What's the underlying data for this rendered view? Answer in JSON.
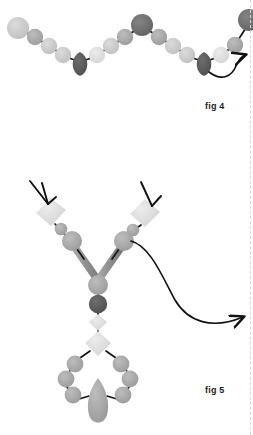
{
  "page": {
    "background_color": "#ffffff",
    "width": 253,
    "height": 435,
    "edge_rule_color": "#d7d7d7"
  },
  "palette": {
    "bead_light": "#c9c9c9",
    "bead_mid": "#a8a8a8",
    "bead_dark": "#6e6e6e",
    "bead_very_dark": "#5a5a5a",
    "bead_pale": "#e2e2e2",
    "cord": "#1a1a1a",
    "arrow": "#111111",
    "label_text": "#1d1d1d"
  },
  "figures": [
    {
      "id": "fig4",
      "label": "fig 4",
      "caption_position": {
        "x": 205,
        "y": 101
      },
      "description": "zigzag beaded chain with dark drop beads at the two valleys",
      "arrow": {
        "name": "pointer-arrow-fig4",
        "from": {
          "x": 70,
          "y": 66
        },
        "to": {
          "x": 246,
          "y": 55
        },
        "style": "curved"
      },
      "beads": [
        {
          "shape": "circle",
          "cx": 18,
          "cy": 28,
          "r": 11,
          "tone": "bead_light"
        },
        {
          "shape": "circle",
          "cx": 35,
          "cy": 37,
          "r": 8,
          "tone": "bead_mid"
        },
        {
          "shape": "circle",
          "cx": 49,
          "cy": 46,
          "r": 8,
          "tone": "bead_light"
        },
        {
          "shape": "circle",
          "cx": 63,
          "cy": 55,
          "r": 8,
          "tone": "bead_light"
        },
        {
          "shape": "drop",
          "cx": 80,
          "cy": 66,
          "r": 10,
          "tone": "bead_very_dark"
        },
        {
          "shape": "circle",
          "cx": 97,
          "cy": 55,
          "r": 8,
          "tone": "bead_pale"
        },
        {
          "shape": "circle",
          "cx": 111,
          "cy": 46,
          "r": 8,
          "tone": "bead_light"
        },
        {
          "shape": "circle",
          "cx": 125,
          "cy": 37,
          "r": 8,
          "tone": "bead_mid"
        },
        {
          "shape": "circle",
          "cx": 142,
          "cy": 25,
          "r": 11,
          "tone": "bead_dark"
        },
        {
          "shape": "circle",
          "cx": 159,
          "cy": 37,
          "r": 8,
          "tone": "bead_mid"
        },
        {
          "shape": "circle",
          "cx": 173,
          "cy": 46,
          "r": 8,
          "tone": "bead_light"
        },
        {
          "shape": "circle",
          "cx": 187,
          "cy": 55,
          "r": 8,
          "tone": "bead_light"
        },
        {
          "shape": "drop",
          "cx": 204,
          "cy": 66,
          "r": 10,
          "tone": "bead_very_dark"
        },
        {
          "shape": "circle",
          "cx": 221,
          "cy": 55,
          "r": 8,
          "tone": "bead_pale"
        },
        {
          "shape": "circle",
          "cx": 235,
          "cy": 45,
          "r": 8,
          "tone": "bead_mid"
        },
        {
          "shape": "circle",
          "cx": 249,
          "cy": 20,
          "r": 11,
          "tone": "bead_dark"
        }
      ],
      "cords": [
        {
          "from": {
            "x": 18,
            "y": 28
          },
          "to": {
            "x": 35,
            "y": 37
          }
        },
        {
          "from": {
            "x": 35,
            "y": 37
          },
          "to": {
            "x": 49,
            "y": 46
          }
        },
        {
          "from": {
            "x": 49,
            "y": 46
          },
          "to": {
            "x": 63,
            "y": 55
          }
        },
        {
          "from": {
            "x": 63,
            "y": 55
          },
          "to": {
            "x": 80,
            "y": 62
          }
        },
        {
          "from": {
            "x": 80,
            "y": 62
          },
          "to": {
            "x": 97,
            "y": 55
          }
        },
        {
          "from": {
            "x": 97,
            "y": 55
          },
          "to": {
            "x": 111,
            "y": 46
          }
        },
        {
          "from": {
            "x": 111,
            "y": 46
          },
          "to": {
            "x": 125,
            "y": 37
          }
        },
        {
          "from": {
            "x": 125,
            "y": 37
          },
          "to": {
            "x": 142,
            "y": 25
          }
        },
        {
          "from": {
            "x": 142,
            "y": 25
          },
          "to": {
            "x": 159,
            "y": 37
          }
        },
        {
          "from": {
            "x": 159,
            "y": 37
          },
          "to": {
            "x": 173,
            "y": 46
          }
        },
        {
          "from": {
            "x": 173,
            "y": 46
          },
          "to": {
            "x": 187,
            "y": 55
          }
        },
        {
          "from": {
            "x": 187,
            "y": 55
          },
          "to": {
            "x": 204,
            "y": 62
          }
        },
        {
          "from": {
            "x": 204,
            "y": 62
          },
          "to": {
            "x": 221,
            "y": 55
          }
        },
        {
          "from": {
            "x": 221,
            "y": 55
          },
          "to": {
            "x": 235,
            "y": 45
          }
        },
        {
          "from": {
            "x": 235,
            "y": 45
          },
          "to": {
            "x": 249,
            "y": 22
          }
        }
      ]
    },
    {
      "id": "fig5",
      "label": "fig 5",
      "caption_position": {
        "x": 205,
        "y": 385
      },
      "description": "Y-shaped beaded necklace: two upper arms with pale diamond beads marked by arrowheads, joining at a central bead column and finishing in a bead ring with teardrop pendant",
      "arrow": {
        "name": "pointer-arrow-fig5",
        "from": {
          "x": 128,
          "y": 239
        },
        "to": {
          "x": 246,
          "y": 318
        },
        "style": "s-curve"
      },
      "arrowheads": [
        {
          "name": "arrowhead-left-diamond",
          "tip": {
            "x": 48,
            "y": 203
          },
          "from": {
            "x": 30,
            "y": 181
          }
        },
        {
          "name": "arrowhead-right-diamond",
          "tip": {
            "x": 152,
            "y": 205
          },
          "from": {
            "x": 145,
            "y": 182
          }
        }
      ],
      "beads": [
        {
          "shape": "diamond",
          "cx": 51,
          "cy": 212,
          "r": 14,
          "tone": "bead_pale"
        },
        {
          "shape": "circle",
          "cx": 61,
          "cy": 229,
          "r": 6,
          "tone": "bead_mid"
        },
        {
          "shape": "circle",
          "cx": 72,
          "cy": 241,
          "r": 10,
          "tone": "bead_mid"
        },
        {
          "shape": "diamond",
          "cx": 145,
          "cy": 213,
          "r": 14,
          "tone": "bead_pale"
        },
        {
          "shape": "circle",
          "cx": 133,
          "cy": 230,
          "r": 6,
          "tone": "bead_mid"
        },
        {
          "shape": "circle",
          "cx": 124,
          "cy": 241,
          "r": 10,
          "tone": "bead_mid"
        },
        {
          "shape": "circle",
          "cx": 98,
          "cy": 285,
          "r": 10,
          "tone": "bead_mid"
        },
        {
          "shape": "circle",
          "cx": 98,
          "cy": 304,
          "r": 9,
          "tone": "bead_very_dark"
        },
        {
          "shape": "diamond",
          "cx": 98,
          "cy": 322,
          "r": 8,
          "tone": "bead_pale"
        },
        {
          "shape": "diamond",
          "cx": 98,
          "cy": 343,
          "r": 12,
          "tone": "bead_pale"
        },
        {
          "shape": "circle",
          "cx": 75,
          "cy": 364,
          "r": 8,
          "tone": "bead_mid"
        },
        {
          "shape": "circle",
          "cx": 66,
          "cy": 379,
          "r": 8,
          "tone": "bead_mid"
        },
        {
          "shape": "circle",
          "cx": 72,
          "cy": 395,
          "r": 8,
          "tone": "bead_mid"
        },
        {
          "shape": "circle",
          "cx": 121,
          "cy": 364,
          "r": 8,
          "tone": "bead_mid"
        },
        {
          "shape": "circle",
          "cx": 130,
          "cy": 379,
          "r": 8,
          "tone": "bead_mid"
        },
        {
          "shape": "circle",
          "cx": 124,
          "cy": 395,
          "r": 8,
          "tone": "bead_mid"
        },
        {
          "shape": "teardrop",
          "cx": 98,
          "cy": 400,
          "r": 13,
          "tone": "bead_mid"
        }
      ],
      "tube_links": [
        {
          "from": {
            "x": 78,
            "y": 250
          },
          "to": {
            "x": 95,
            "y": 277
          }
        },
        {
          "from": {
            "x": 118,
            "y": 250
          },
          "to": {
            "x": 101,
            "y": 277
          }
        }
      ]
    }
  ]
}
